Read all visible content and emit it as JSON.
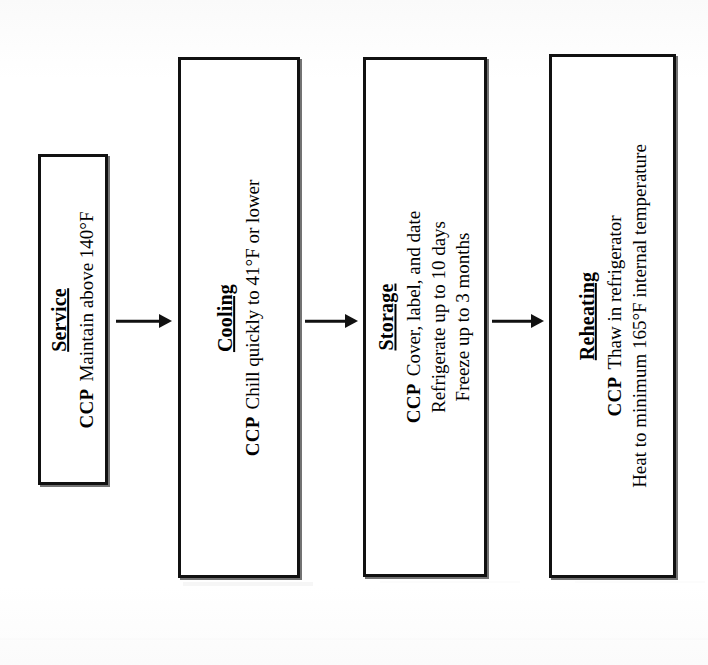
{
  "diagram": {
    "orientation": "horizontal-left-to-right",
    "text_rotation": "-90deg",
    "colors": {
      "background": "#ffffff",
      "box_border": "#111111",
      "text": "#000000",
      "arrow": "#111111"
    },
    "ccp_label": "CCP",
    "steps": [
      {
        "id": "service",
        "title": "Service",
        "ccp": "CCP",
        "lines": [
          "Maintain above 140°F"
        ],
        "box": {
          "x": 38,
          "y": 154,
          "w": 70,
          "h": 331
        }
      },
      {
        "id": "cooling",
        "title": "Cooling",
        "ccp": "CCP",
        "lines": [
          "Chill quickly to 41°F or lower"
        ],
        "box": {
          "x": 178,
          "y": 57,
          "w": 122,
          "h": 521
        }
      },
      {
        "id": "storage",
        "title": "Storage",
        "ccp": "CCP",
        "lines": [
          "Cover, label, and date",
          "Refrigerate up to 10 days",
          "Freeze up to 3 months"
        ],
        "box": {
          "x": 363,
          "y": 57,
          "w": 124,
          "h": 520
        }
      },
      {
        "id": "reheating",
        "title": "Reheating",
        "ccp": "CCP",
        "lines": [
          "Thaw in refrigerator",
          "Heat to minimum 165°F internal temperature"
        ],
        "box": {
          "x": 549,
          "y": 54,
          "w": 127,
          "h": 524
        }
      }
    ],
    "arrows": [
      {
        "id": "arrow-service-to-cooling",
        "x": 116,
        "y": 310,
        "w": 56,
        "from": "Service",
        "to": "Cooling"
      },
      {
        "id": "arrow-cooling-to-storage",
        "x": 305,
        "y": 310,
        "w": 53,
        "from": "Cooling",
        "to": "Storage"
      },
      {
        "id": "arrow-storage-to-reheating",
        "x": 492,
        "y": 310,
        "w": 52,
        "from": "Storage",
        "to": "Reheating"
      }
    ]
  }
}
